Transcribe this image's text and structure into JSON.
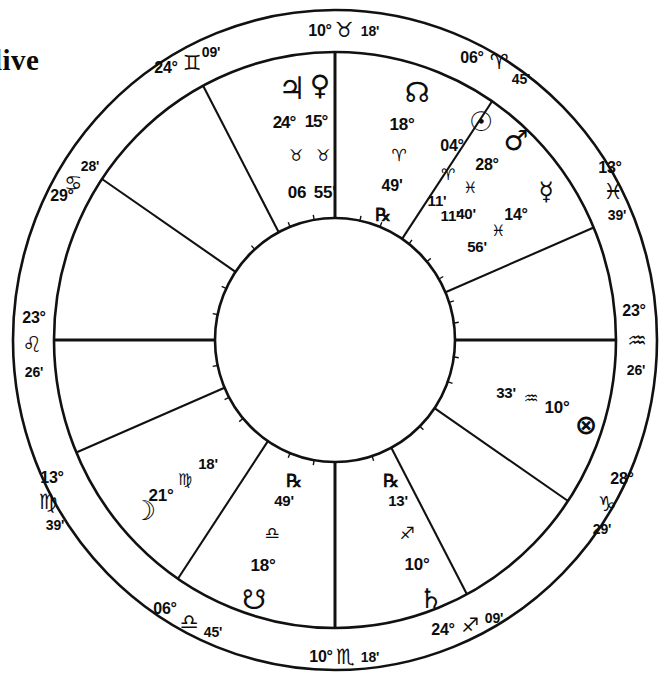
{
  "page": {
    "corner_text": "live",
    "width": 660,
    "height": 677
  },
  "chart_data": {
    "type": "chart-wheel",
    "subtype": "equal-house natal wheel",
    "center": {
      "x": 335,
      "y": 340
    },
    "radii": {
      "outer": 323,
      "middle": 282,
      "inner": 120
    },
    "ink_color": "#111111",
    "background": "#ffffff",
    "sign_glyphs": {
      "aries": "♈",
      "taurus": "♉",
      "gemini": "♊",
      "cancer": "♋",
      "leo": "♌",
      "virgo": "♍",
      "libra": "♎",
      "scorpio": "♏",
      "sagittarius": "♐",
      "capricorn": "♑",
      "aquarius": "♒",
      "pisces": "♓"
    },
    "planet_glyphs": {
      "sun": "☉",
      "moon": "☽",
      "mercury": "☿",
      "venus": "♀",
      "mars": "♂",
      "jupiter": "♃",
      "saturn": "♄",
      "uranus": "⚷",
      "north_node": "☊",
      "south_node": "☋",
      "part_of_fortune": "⊗",
      "retrograde": "℞"
    },
    "cusps": [
      {
        "id": "mc",
        "house": 10,
        "label": "MC",
        "degree": "10°",
        "sign": "taurus",
        "sign_glyph": "♉",
        "minute": "18'",
        "angle_deg": 90,
        "is_axis": true
      },
      {
        "id": "c11",
        "house": 11,
        "label": "11th",
        "degree": "06°",
        "sign": "aries",
        "sign_glyph": "♈",
        "minute": "45'",
        "angle_deg": 56,
        "is_axis": false
      },
      {
        "id": "c12",
        "house": 12,
        "label": "12th",
        "degree": "13°",
        "sign": "pisces",
        "sign_glyph": "♓",
        "minute": "39'",
        "angle_deg": 23,
        "is_axis": false
      },
      {
        "id": "dsc",
        "house": 7,
        "label": "DSC",
        "degree": "23°",
        "sign": "aquarius",
        "sign_glyph": "♒",
        "minute": "26'",
        "angle_deg": 0,
        "is_axis": true
      },
      {
        "id": "c2",
        "house": 2,
        "label": "2nd",
        "degree": "28°",
        "sign": "capricorn",
        "sign_glyph": "♑",
        "minute": "29'",
        "angle_deg": -34,
        "is_axis": false
      },
      {
        "id": "c3",
        "house": 3,
        "label": "3rd",
        "degree": "24°",
        "sign": "sagittarius",
        "sign_glyph": "♐",
        "minute": "09'",
        "angle_deg": -62,
        "is_axis": false
      },
      {
        "id": "ic",
        "house": 4,
        "label": "IC",
        "degree": "10°",
        "sign": "scorpio",
        "sign_glyph": "♏",
        "minute": "18'",
        "angle_deg": -90,
        "is_axis": true
      },
      {
        "id": "c5",
        "house": 5,
        "label": "5th",
        "degree": "06°",
        "sign": "libra",
        "sign_glyph": "♎",
        "minute": "45'",
        "angle_deg": -124,
        "is_axis": false
      },
      {
        "id": "c6",
        "house": 6,
        "label": "6th",
        "degree": "13°",
        "sign": "virgo",
        "sign_glyph": "♍",
        "minute": "39'",
        "angle_deg": -157,
        "is_axis": false
      },
      {
        "id": "asc",
        "house": 1,
        "label": "ASC",
        "degree": "23°",
        "sign": "leo",
        "sign_glyph": "♌",
        "minute": "26'",
        "angle_deg": 180,
        "is_axis": true
      },
      {
        "id": "c8",
        "house": 8,
        "label": "8th",
        "degree": "29°",
        "sign": "cancer",
        "sign_glyph": "♋",
        "minute": "28'",
        "angle_deg": 146,
        "is_axis": false
      },
      {
        "id": "c9",
        "house": 9,
        "label": "9th",
        "degree": "24°",
        "sign": "gemini",
        "sign_glyph": "♊",
        "minute": "09'",
        "angle_deg": 118,
        "is_axis": false
      }
    ],
    "planets": [
      {
        "id": "jupiter",
        "name": "Jupiter",
        "glyph": "♃",
        "degree": "24°",
        "sign": "taurus",
        "sign_glyph": "♉",
        "minute": "06",
        "retrograde": false
      },
      {
        "id": "venus",
        "name": "Venus",
        "glyph": "♀",
        "degree": "15°",
        "sign": "taurus",
        "sign_glyph": "♉",
        "minute": "55'",
        "retrograde": false
      },
      {
        "id": "north-node",
        "name": "North Node",
        "glyph": "☊",
        "degree": "18°",
        "sign": "aries",
        "sign_glyph": "♈",
        "minute": "49'",
        "retrograde": true
      },
      {
        "id": "sun",
        "name": "Sun",
        "glyph": "☉",
        "degree": "04°",
        "sign": "aries",
        "sign_glyph": "♈",
        "minute": "11'",
        "retrograde": false
      },
      {
        "id": "mars",
        "name": "Mars",
        "glyph": "♂",
        "degree": "28°",
        "sign": "pisces",
        "sign_glyph": "♓",
        "minute": "40'",
        "retrograde": false
      },
      {
        "id": "mercury",
        "name": "Mercury",
        "glyph": "☿",
        "degree": "14°",
        "sign": "pisces",
        "sign_glyph": "♓",
        "minute": "56'",
        "retrograde": false
      },
      {
        "id": "part-of-fortune",
        "name": "Part of Fortune",
        "glyph": "⊗",
        "degree": "10°",
        "sign": "aquarius",
        "sign_glyph": "♒",
        "minute": "33'",
        "retrograde": false
      },
      {
        "id": "saturn",
        "name": "Saturn",
        "glyph": "♄",
        "degree": "10°",
        "sign": "sagittarius",
        "sign_glyph": "♐",
        "minute": "13'",
        "retrograde": true
      },
      {
        "id": "south-node",
        "name": "South Node",
        "glyph": "☋",
        "degree": "18°",
        "sign": "libra",
        "sign_glyph": "♎",
        "minute": "49'",
        "retrograde": true
      },
      {
        "id": "moon",
        "name": "Moon",
        "glyph": "☽",
        "degree": "21°",
        "sign": "virgo",
        "sign_glyph": "♍",
        "minute": "18'",
        "retrograde": false
      }
    ],
    "extra_text": {
      "jupiter_minute_pair": "06",
      "venus_minute_pair": "55'",
      "jupiter_venus_degrees": "24°15°"
    }
  }
}
